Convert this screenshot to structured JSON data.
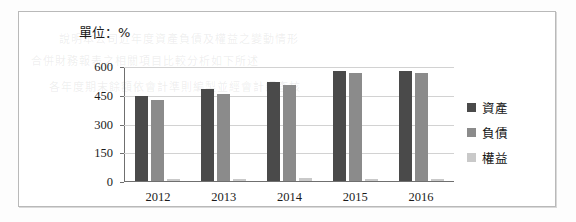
{
  "figure": {
    "unit_caption": "單位：%"
  },
  "chart_data": {
    "type": "bar",
    "title": "",
    "subtitle": "",
    "xlabel": "",
    "ylabel": "",
    "unit_label": "單位：%",
    "categories": [
      "2012",
      "2013",
      "2014",
      "2015",
      "2016"
    ],
    "series": [
      {
        "name": "資產",
        "color": "#4a4a4a",
        "values": [
          450,
          485,
          520,
          580,
          578
        ]
      },
      {
        "name": "負債",
        "color": "#8b8b8b",
        "values": [
          425,
          458,
          505,
          568,
          566
        ]
      },
      {
        "name": "權益",
        "color": "#c9c9c9",
        "values": [
          12,
          12,
          14,
          12,
          11
        ]
      }
    ],
    "ylim": [
      0,
      600
    ],
    "yticks": [
      0,
      150,
      300,
      450,
      600
    ],
    "ytick_labels": [
      "0",
      "150",
      "300",
      "450",
      "600"
    ],
    "grid": true,
    "legend_position": "right",
    "legend_entries": [
      "資產",
      "負債",
      "權益"
    ]
  },
  "bleed_text": [
    "說明本公司近年度資產負債及權益之變動情形",
    "合併財務報表之相關項目比較分析如下所述",
    "各年度期末餘額依會計準則編製並經會計師查核"
  ]
}
